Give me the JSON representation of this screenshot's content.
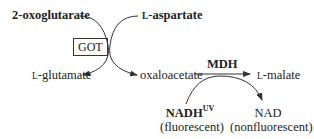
{
  "diagram": {
    "substrates": {
      "oxoglutarate": "2-oxoglutarate",
      "aspartate_prefix": "L",
      "aspartate_name": "-aspartate"
    },
    "enzymes": {
      "got": "GOT",
      "mdh": "MDH"
    },
    "products": {
      "glutamate_prefix": "L",
      "glutamate_name": "-glutamate",
      "oxaloacetate": "oxaloacetate",
      "malate_prefix": "L",
      "malate_name": "-malate"
    },
    "cofactors": {
      "nadh": "NADH",
      "nadh_sup": "UV",
      "nadh_note": "(fluorescent)",
      "nad": "NAD",
      "nad_note": "(nonfluorescent)"
    },
    "colors": {
      "line": "#333333",
      "text": "#222222"
    }
  }
}
